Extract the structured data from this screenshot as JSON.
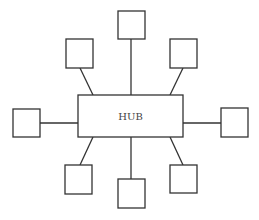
{
  "diagram": {
    "hub": {
      "label": "HUB",
      "x": 78,
      "y": 95,
      "width": 105,
      "height": 42
    },
    "stroke_color": "#333333",
    "nodes": [
      {
        "id": "top",
        "x": 118,
        "y": 11,
        "w": 27,
        "h": 28,
        "line": [
          131,
          39,
          131,
          95
        ]
      },
      {
        "id": "upper-left",
        "x": 66,
        "y": 39,
        "w": 27,
        "h": 29,
        "line": [
          80,
          68,
          93,
          95
        ]
      },
      {
        "id": "upper-right",
        "x": 170,
        "y": 39,
        "w": 27,
        "h": 29,
        "line": [
          183,
          68,
          170,
          95
        ]
      },
      {
        "id": "left",
        "x": 13,
        "y": 109,
        "w": 27,
        "h": 28,
        "line": [
          40,
          123,
          78,
          123
        ]
      },
      {
        "id": "right",
        "x": 221,
        "y": 108,
        "w": 27,
        "h": 29,
        "line": [
          183,
          123,
          221,
          123
        ]
      },
      {
        "id": "lower-left",
        "x": 65,
        "y": 165,
        "w": 27,
        "h": 29,
        "line": [
          93,
          137,
          80,
          165
        ]
      },
      {
        "id": "bottom",
        "x": 118,
        "y": 179,
        "w": 27,
        "h": 29,
        "line": [
          131,
          137,
          131,
          179
        ]
      },
      {
        "id": "lower-right",
        "x": 170,
        "y": 165,
        "w": 27,
        "h": 28,
        "line": [
          170,
          137,
          183,
          165
        ]
      }
    ]
  }
}
